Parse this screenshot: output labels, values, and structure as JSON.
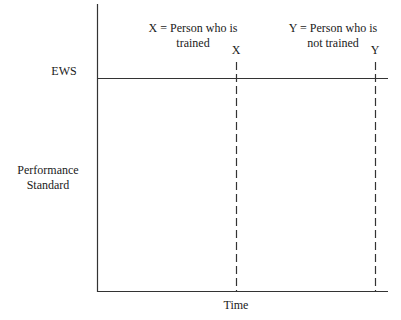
{
  "diagram": {
    "type": "performance-over-time",
    "axes": {
      "x_label": "Time",
      "y_label_line1": "Performance",
      "y_label_line2": "Standard"
    },
    "reference_line": {
      "label": "EWS"
    },
    "legend": {
      "x_line1": "X = Person who is",
      "x_line2": "trained",
      "y_line1": "Y = Person who is",
      "y_line2": "not trained"
    },
    "markers": [
      {
        "label": "X",
        "style": "dashed"
      },
      {
        "label": "Y",
        "style": "dashed"
      }
    ],
    "colors": {
      "line": "#333333",
      "background": "#ffffff"
    }
  }
}
